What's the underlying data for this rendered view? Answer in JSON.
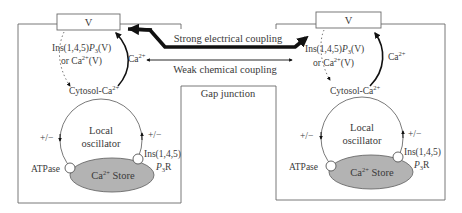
{
  "diagram": {
    "colors": {
      "line": "#5a5a5a",
      "arrow": "#111111",
      "store_fill": "#b3b3b3",
      "text": "#3a3a3a"
    },
    "couplings": {
      "strong": "Strong electrical coupling",
      "weak": "Weak chemical coupling",
      "gap_junction": "Gap junction"
    },
    "cells": [
      {
        "id": "left",
        "membrane_label": "V",
        "ins_label_line1": "Ins(1,4,5)P3(V)",
        "ins_label_line1_main": "Ins(1,4,5)",
        "ins_label_line1_p": "P",
        "ins_label_line1_sub": "3",
        "ins_label_line1_tail": "(V)",
        "ins_label_line2_prefix": "or Ca",
        "ins_label_line2_sup": "2+",
        "ins_label_line2_tail": "(V)",
        "ca_label": "Ca",
        "ca_sup": "2+",
        "cytosol_label": "Cytosol-Ca",
        "cytosol_sup": "2+",
        "oscillator_line1": "Local",
        "oscillator_line2": "oscillator",
        "plus_minus_left": "+/−",
        "plus_minus_right": "+/−",
        "atpase_label": "ATPase",
        "store_label_prefix": "Ca",
        "store_label_sup": "2+",
        "store_label_suffix": " Store",
        "receptor_line1": "Ins(1,4,5)",
        "receptor_line2_p": "P",
        "receptor_line2_sub": "3",
        "receptor_line2_tail": "R"
      },
      {
        "id": "right",
        "membrane_label": "V",
        "ins_label_line1_main": "Ins(1,4,5)",
        "ins_label_line1_p": "P",
        "ins_label_line1_sub": "3",
        "ins_label_line1_tail": "(V)",
        "ins_label_line2_prefix": "or Ca",
        "ins_label_line2_sup": "2+",
        "ins_label_line2_tail": "(V)",
        "ca_label": "Ca",
        "ca_sup": "2+",
        "cytosol_label": "Cytosol-Ca",
        "cytosol_sup": "2+",
        "oscillator_line1": "Local",
        "oscillator_line2": "oscillator",
        "plus_minus_left": "+/−",
        "plus_minus_right": "+/−",
        "atpase_label": "ATPase",
        "store_label_prefix": "Ca",
        "store_label_sup": "2+",
        "store_label_suffix": " Store",
        "receptor_line1": "Ins(1,4,5)",
        "receptor_line2_p": "P",
        "receptor_line2_sub": "3",
        "receptor_line2_tail": "R"
      }
    ]
  }
}
